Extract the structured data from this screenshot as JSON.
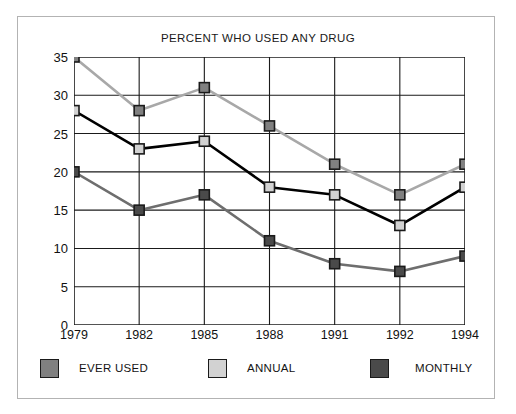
{
  "chart_data": {
    "type": "line",
    "title": "PERCENT WHO USED ANY DRUG",
    "xlabel": "",
    "ylabel": "",
    "categories": [
      "1979",
      "1982",
      "1985",
      "1988",
      "1991",
      "1992",
      "1994"
    ],
    "ylim": [
      0,
      35
    ],
    "yticks": [
      "0",
      "5",
      "10",
      "15",
      "20",
      "25",
      "30",
      "35"
    ],
    "ytick_values": [
      0,
      5,
      10,
      15,
      20,
      25,
      30,
      35
    ],
    "grid": "horizontal-and-vertical",
    "legend_position": "bottom",
    "series": [
      {
        "name": "EVER USED",
        "values": [
          35,
          28,
          31,
          26,
          21,
          17,
          21
        ],
        "line_color": "#a8a8a8",
        "marker_color": "#808080",
        "marker_edge": "#1a1a1a",
        "legend_swatch_color": "#808080"
      },
      {
        "name": "ANNUAL",
        "values": [
          28,
          23,
          24,
          18,
          17,
          13,
          18
        ],
        "line_color": "#000000",
        "marker_color": "#d2d2d2",
        "marker_edge": "#1a1a1a",
        "legend_swatch_color": "#d2d2d2"
      },
      {
        "name": "MONTHLY",
        "values": [
          20,
          15,
          17,
          11,
          8,
          7,
          9
        ],
        "line_color": "#6e6e6e",
        "marker_color": "#4a4a4a",
        "marker_edge": "#1a1a1a",
        "legend_swatch_color": "#4a4a4a"
      }
    ]
  },
  "legend": {
    "items": [
      {
        "label": "EVER USED"
      },
      {
        "label": "ANNUAL"
      },
      {
        "label": "MONTHLY"
      }
    ]
  },
  "colors": {
    "axis": "#1a1a1a",
    "grid": "#1a1a1a",
    "frame": "#b3b3b3",
    "background": "#ffffff",
    "text": "#111111"
  }
}
